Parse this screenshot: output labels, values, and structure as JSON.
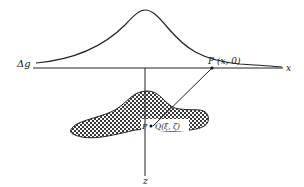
{
  "diagram": {
    "type": "gravity-anomaly-schematic",
    "labels": {
      "anomaly": "Δg",
      "x_axis": "x",
      "z_axis": "z",
      "observation_point": "P (x, 0)",
      "body_point_p": "P",
      "source_point": "Q(ξ, ζ)"
    },
    "colors": {
      "line": "#222222",
      "body_fill": "#555555",
      "background": "#ffffff"
    }
  }
}
